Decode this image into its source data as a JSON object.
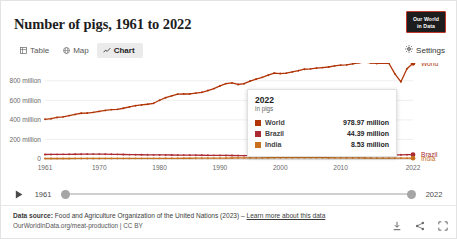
{
  "header": {
    "title": "Number of pigs, 1961 to 2022",
    "logo_line1": "Our World",
    "logo_line2": "in Data",
    "settings_label": "Settings"
  },
  "tabs": [
    {
      "label": "Table",
      "icon": "table-icon",
      "active": false
    },
    {
      "label": "Map",
      "icon": "globe-icon",
      "active": false
    },
    {
      "label": "Chart",
      "icon": "chart-icon",
      "active": true
    }
  ],
  "tooltip": {
    "year": "2022",
    "unit": "in pigs",
    "rows": [
      {
        "name": "World",
        "value": "978.97 million",
        "color": "#b13507"
      },
      {
        "name": "Brazil",
        "value": "44.39 million",
        "color": "#ac2a32"
      },
      {
        "name": "India",
        "value": "8.53 million",
        "color": "#c7711f"
      }
    ]
  },
  "timeline": {
    "play_label": "play-button",
    "start_year": "1961",
    "end_year": "2022"
  },
  "footer": {
    "source_label": "Data source:",
    "source_text": "Food and Agriculture Organization of the United Nations (2023)",
    "separator": "–",
    "link_text": "Learn more about this data",
    "attribution": "OurWorldInData.org/meat-production | CC BY",
    "icons": [
      "download-icon",
      "share-icon",
      "expand-icon"
    ]
  },
  "chart_data": {
    "type": "line",
    "title": "Number of pigs, 1961 to 2022",
    "xlabel": "",
    "ylabel": "",
    "unit": "in pigs",
    "xlim": [
      1961,
      2022
    ],
    "ylim": [
      0,
      900000000
    ],
    "grid": true,
    "legend_position": "right",
    "y_ticks": [
      {
        "value": 0,
        "label": "0"
      },
      {
        "value": 200000000,
        "label": "200 million"
      },
      {
        "value": 400000000,
        "label": "400 million"
      },
      {
        "value": 600000000,
        "label": "600 million"
      },
      {
        "value": 800000000,
        "label": "800 million"
      }
    ],
    "x_ticks": [
      {
        "value": 1961,
        "label": "1961"
      },
      {
        "value": 1970,
        "label": "1970"
      },
      {
        "value": 1980,
        "label": "1980"
      },
      {
        "value": 1990,
        "label": "1990"
      },
      {
        "value": 2000,
        "label": "2000"
      },
      {
        "value": 2010,
        "label": "2010"
      },
      {
        "value": 2022,
        "label": "2022"
      }
    ],
    "x": [
      1961,
      1962,
      1963,
      1964,
      1965,
      1966,
      1967,
      1968,
      1969,
      1970,
      1971,
      1972,
      1973,
      1974,
      1975,
      1976,
      1977,
      1978,
      1979,
      1980,
      1981,
      1982,
      1983,
      1984,
      1985,
      1986,
      1987,
      1988,
      1989,
      1990,
      1991,
      1992,
      1993,
      1994,
      1995,
      1996,
      1997,
      1998,
      1999,
      2000,
      2001,
      2002,
      2003,
      2004,
      2005,
      2006,
      2007,
      2008,
      2009,
      2010,
      2011,
      2012,
      2013,
      2014,
      2015,
      2016,
      2017,
      2018,
      2019,
      2020,
      2021,
      2022
    ],
    "series": [
      {
        "name": "World",
        "color": "#b13507",
        "end_label": "World",
        "values": [
          406000000,
          412000000,
          425000000,
          431000000,
          444000000,
          456000000,
          468000000,
          470000000,
          477000000,
          487000000,
          497000000,
          505000000,
          508000000,
          519000000,
          532000000,
          545000000,
          553000000,
          560000000,
          570000000,
          601000000,
          627000000,
          646000000,
          663000000,
          665000000,
          665000000,
          674000000,
          682000000,
          700000000,
          720000000,
          747000000,
          771000000,
          779000000,
          762000000,
          770000000,
          797000000,
          818000000,
          835000000,
          857000000,
          879000000,
          874000000,
          878000000,
          891000000,
          903000000,
          918000000,
          922000000,
          930000000,
          935000000,
          941000000,
          952000000,
          960000000,
          963000000,
          973000000,
          984000000,
          991000000,
          982000000,
          977000000,
          982000000,
          979000000,
          871000000,
          789000000,
          923000000,
          978970000
        ]
      },
      {
        "name": "Brazil",
        "color": "#ac2a32",
        "end_label": "Brazil",
        "values": [
          46000000,
          46500000,
          47000000,
          47500000,
          48000000,
          48500000,
          49000000,
          49500000,
          50000000,
          50000000,
          49000000,
          48000000,
          47000000,
          46000000,
          45000000,
          44000000,
          43500000,
          43000000,
          42500000,
          42000000,
          41500000,
          41000000,
          40500000,
          40000000,
          39500000,
          39000000,
          38500000,
          38000000,
          37500000,
          37000000,
          36500000,
          36000000,
          35500000,
          35000000,
          34500000,
          34000000,
          33500000,
          33000000,
          32500000,
          32000000,
          32500000,
          33000000,
          33500000,
          34000000,
          34500000,
          35000000,
          35500000,
          36000000,
          36500000,
          37000000,
          38000000,
          39000000,
          39500000,
          40000000,
          40500000,
          41000000,
          41500000,
          42000000,
          42500000,
          43000000,
          43800000,
          44390000
        ]
      },
      {
        "name": "India",
        "color": "#c7711f",
        "end_label": "India",
        "values": [
          4900000,
          5000000,
          5100000,
          5200000,
          5300000,
          5400000,
          5500000,
          5600000,
          5700000,
          5800000,
          5900000,
          6000000,
          6100000,
          6200000,
          6300000,
          6400000,
          6500000,
          6600000,
          6700000,
          6800000,
          7000000,
          7200000,
          7400000,
          7600000,
          7800000,
          8000000,
          8200000,
          8400000,
          8600000,
          9000000,
          9500000,
          10000000,
          10500000,
          11000000,
          11500000,
          12000000,
          12500000,
          13000000,
          13200000,
          13400000,
          13600000,
          13800000,
          14000000,
          13800000,
          13600000,
          13400000,
          13200000,
          13000000,
          12500000,
          12000000,
          11500000,
          11000000,
          10500000,
          10000000,
          9500000,
          9200000,
          9000000,
          8800000,
          8700000,
          8600000,
          8550000,
          8530000
        ]
      }
    ]
  }
}
